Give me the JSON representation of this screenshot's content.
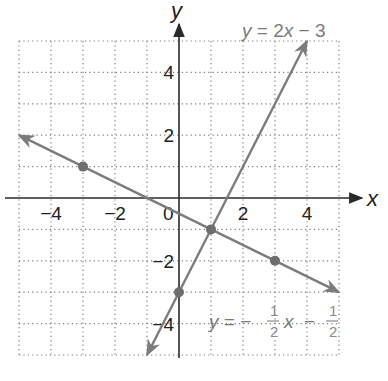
{
  "chart_data": {
    "type": "line",
    "title": "",
    "xlabel": "x",
    "ylabel": "y",
    "xlim": [
      -5,
      5
    ],
    "ylim": [
      -5,
      5
    ],
    "grid": true,
    "grid_style": "dotted",
    "x_ticks": [
      -4,
      -2,
      0,
      2,
      4
    ],
    "y_ticks": [
      4,
      2,
      -2,
      -4
    ],
    "x_tick_labels": [
      "−4",
      "−2",
      "0",
      "2",
      "4"
    ],
    "y_tick_labels": [
      "4",
      "2",
      "−2",
      "−4"
    ],
    "series": [
      {
        "name": "y = 2x − 3",
        "equation": "y = 2x - 3",
        "slope": 2,
        "intercept": -3,
        "x": [
          -1,
          4
        ],
        "y": [
          -5,
          5
        ],
        "arrows": "both",
        "marked_points": [
          [
            0,
            -3
          ],
          [
            1,
            -1
          ]
        ]
      },
      {
        "name": "y = −1/2 x − 1/2",
        "equation": "y = -1/2 x - 1/2",
        "slope": -0.5,
        "intercept": -0.5,
        "x": [
          -5,
          5
        ],
        "y": [
          2,
          -3
        ],
        "arrows": "both",
        "marked_points": [
          [
            -3,
            1
          ],
          [
            1,
            -1
          ],
          [
            3,
            -2
          ]
        ]
      }
    ],
    "intersection": [
      1,
      -1
    ],
    "annotations": [
      {
        "text": "y = 2x − 3",
        "position": "top-right"
      },
      {
        "text": "y = −1/2 x − 1/2",
        "position": "bottom-right"
      }
    ]
  },
  "labels": {
    "x_axis": "x",
    "y_axis": "y",
    "origin": "0",
    "eq1_y": "y",
    "eq1_rest": " = 2",
    "eq1_x": "x",
    "eq1_tail": " − 3",
    "eq2_y": "y",
    "eq2_eq": " = −",
    "eq2_x": "x",
    "eq2_minus": "−",
    "frac_num": "1",
    "frac_den": "2"
  },
  "colors": {
    "line": "#7c7c7c",
    "axis": "#2a2a2a",
    "grid": "#7a7a7a",
    "point": "#6e6e6e"
  }
}
